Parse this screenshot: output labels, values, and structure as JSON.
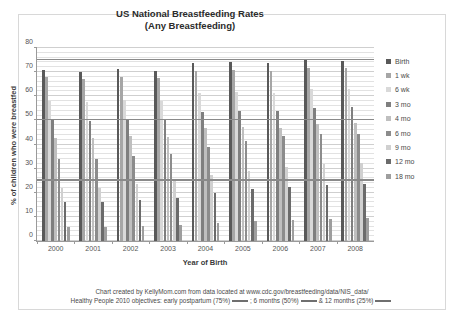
{
  "chart_data": {
    "type": "bar",
    "title": "US National Breastfeeding Rates",
    "subtitle": "(Any Breastfeeding)",
    "xlabel": "Year of Birth",
    "ylabel": "% of children who were breastfed",
    "categories": [
      "2000",
      "2001",
      "2002",
      "2003",
      "2004",
      "2005",
      "2006",
      "2007",
      "2008"
    ],
    "ylim": [
      0,
      80
    ],
    "yticks": [
      0,
      10,
      20,
      30,
      40,
      50,
      60,
      70,
      80
    ],
    "grid": true,
    "legend_position": "right",
    "series": [
      {
        "name": "Birth",
        "color": "#595959",
        "values": [
          70.9,
          70.1,
          71.4,
          70.3,
          73.8,
          74.2,
          73.9,
          75.0,
          74.6
        ]
      },
      {
        "name": "1 wk",
        "color": "#a6a6a6",
        "values": [
          67.8,
          67.0,
          68.0,
          67.6,
          70.6,
          70.8,
          70.4,
          71.8,
          71.6
        ]
      },
      {
        "name": "6 wk",
        "color": "#d9d9d9",
        "values": [
          58.0,
          57.6,
          58.5,
          58.2,
          61.4,
          61.9,
          61.2,
          63.1,
          63.0
        ]
      },
      {
        "name": "3 mo",
        "color": "#7f7f7f",
        "values": [
          50.0,
          49.6,
          50.4,
          50.1,
          53.5,
          54.0,
          53.7,
          55.2,
          55.5
        ]
      },
      {
        "name": "4 mo",
        "color": "#bfbfbf",
        "values": [
          42.9,
          42.5,
          43.5,
          43.2,
          46.7,
          47.1,
          46.8,
          48.5,
          48.9
        ]
      },
      {
        "name": "6 mo",
        "color": "#8c8c8c",
        "values": [
          34.2,
          33.9,
          35.2,
          36.2,
          39.1,
          41.4,
          43.4,
          44.4,
          44.3
        ]
      },
      {
        "name": "9 mo",
        "color": "#d0d0d0",
        "values": [
          22.0,
          22.1,
          23.5,
          24.8,
          27.5,
          29.2,
          30.7,
          32.1,
          32.5
        ]
      },
      {
        "name": "12 mo",
        "color": "#6b6b6b",
        "values": [
          16.1,
          16.3,
          17.2,
          17.8,
          20.1,
          21.4,
          22.4,
          23.4,
          23.7
        ]
      },
      {
        "name": "18 mo",
        "color": "#9e9e9e",
        "values": [
          5.8,
          6.0,
          6.4,
          6.8,
          7.6,
          8.2,
          8.7,
          9.2,
          9.4
        ]
      }
    ],
    "reference_lines": [
      {
        "label": "early postpartum (75%)",
        "value": 75
      },
      {
        "label": "6 months (50%)",
        "value": 50
      },
      {
        "label": "12 months (25%)",
        "value": 25
      }
    ],
    "footnote_line1": "Chart created by KellyMom.com from data located at www.cdc.gov/breastfeeding/data/NIS_data/",
    "footnote_line2_a": "Healthy People 2010 objectives: early postpartum (75%)",
    "footnote_line2_b": ";  6 months (50%)",
    "footnote_line2_c": "& 12 months (25%)"
  }
}
